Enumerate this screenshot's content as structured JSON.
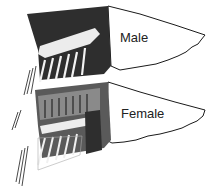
{
  "figure": {
    "labels": {
      "male": "Male",
      "female": "Female"
    },
    "colors": {
      "dark": "#2a2a2a",
      "mid": "#6a6a6a",
      "light": "#e8e8e8",
      "outline": "#1a1a1a"
    }
  }
}
